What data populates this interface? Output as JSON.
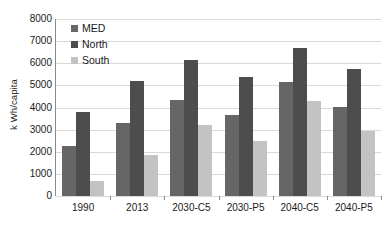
{
  "chart_data": {
    "type": "bar",
    "title": "",
    "xlabel": "",
    "ylabel": "k Wh/capita",
    "ylim": [
      0,
      8000
    ],
    "ytick_labels": [
      "8000",
      "7000",
      "6000",
      "5000",
      "4000",
      "3000",
      "2000",
      "1000",
      "0"
    ],
    "ytick_values": [
      8000,
      7000,
      6000,
      5000,
      4000,
      3000,
      2000,
      1000,
      0
    ],
    "grid": true,
    "legend_position": "upper-left-inside",
    "categories": [
      "1990",
      "2013",
      "2030-C5",
      "2030-P5",
      "2040-C5",
      "2040-P5"
    ],
    "series": [
      {
        "name": "MED",
        "color": "#666666",
        "values": [
          2250,
          3300,
          4350,
          3650,
          5150,
          4020
        ]
      },
      {
        "name": "North",
        "color": "#4d4d4d",
        "values": [
          3800,
          5220,
          6130,
          5380,
          6700,
          5750
        ]
      },
      {
        "name": "South",
        "color": "#c3c3c3",
        "values": [
          700,
          1840,
          3200,
          2480,
          4300,
          2950
        ]
      }
    ]
  }
}
